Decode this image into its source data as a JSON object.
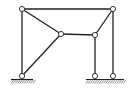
{
  "diagram": {
    "type": "structural-frame",
    "line_color": "#222222",
    "background": "#ffffff",
    "nodes": [
      {
        "id": "A",
        "label": "",
        "x": 22,
        "y": 9
      },
      {
        "id": "B",
        "label": "",
        "x": 113,
        "y": 9
      },
      {
        "id": "C",
        "label": "",
        "x": 61,
        "y": 34
      },
      {
        "id": "D",
        "label": "",
        "x": 95,
        "y": 35
      },
      {
        "id": "E",
        "label": "",
        "x": 22,
        "y": 76
      },
      {
        "id": "F",
        "label": "",
        "x": 95,
        "y": 76
      },
      {
        "id": "G",
        "label": "",
        "x": 113,
        "y": 76
      }
    ],
    "members": [
      {
        "from": "A",
        "to": "B"
      },
      {
        "from": "A",
        "to": "E"
      },
      {
        "from": "A",
        "to": "C"
      },
      {
        "from": "C",
        "to": "E"
      },
      {
        "from": "C",
        "to": "D"
      },
      {
        "from": "D",
        "to": "B"
      },
      {
        "from": "D",
        "to": "F"
      },
      {
        "from": "B",
        "to": "G"
      }
    ],
    "supports": [
      {
        "node": "E",
        "type": "pin",
        "ground_x1": 11,
        "ground_x2": 33
      },
      {
        "node": "F",
        "type": "pin",
        "ground_x1": 86,
        "ground_x2": 124
      },
      {
        "node": "G",
        "type": "pin",
        "ground_x1": 86,
        "ground_x2": 124
      }
    ]
  }
}
